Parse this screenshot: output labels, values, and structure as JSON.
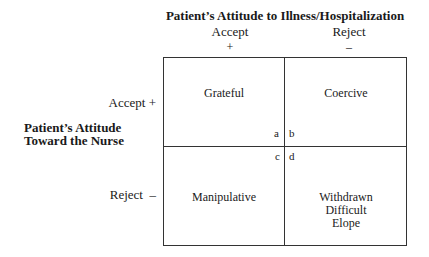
{
  "title": "Patient’s Attitude to Illness/Hospitalization",
  "columns": [
    {
      "label": "Accept",
      "sign": "+"
    },
    {
      "label": "Reject",
      "sign": "–"
    }
  ],
  "rows": [
    {
      "label": "Accept +"
    },
    {
      "label": "Reject  –"
    }
  ],
  "row_axis_title": [
    "Patient’s Attitude",
    "Toward the Nurse"
  ],
  "cells": {
    "a": {
      "corner": "a",
      "text": "Grateful"
    },
    "b": {
      "corner": "b",
      "text": "Coercive"
    },
    "c": {
      "corner": "c",
      "text": "Manipulative"
    },
    "d": {
      "corner": "d",
      "lines": [
        "Withdrawn",
        "Difficult",
        "Elope"
      ]
    }
  }
}
